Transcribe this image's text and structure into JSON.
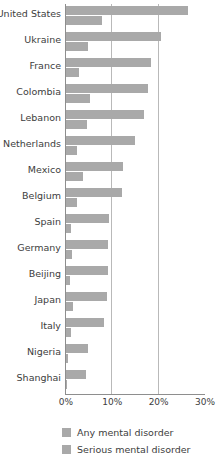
{
  "chart_data": {
    "type": "bar",
    "orientation": "horizontal",
    "title": "",
    "subtitle": "",
    "xlabel": "",
    "ylabel": "",
    "xlim": [
      0,
      30
    ],
    "xtick_labels": [
      "0%",
      "10%",
      "20%",
      "30%"
    ],
    "xtick_values": [
      0,
      10,
      20,
      30
    ],
    "grid": "vertical",
    "legend_position": "bottom",
    "categories": [
      "United States",
      "Ukraine",
      "France",
      "Colombia",
      "Lebanon",
      "Netherlands",
      "Mexico",
      "Belgium",
      "Spain",
      "Germany",
      "Beijing",
      "Japan",
      "Italy",
      "Nigeria",
      "Shanghai"
    ],
    "series": [
      {
        "name": "Any mental disorder",
        "color": "#a9a9a9",
        "values": [
          26.4,
          20.5,
          18.4,
          17.8,
          16.9,
          14.9,
          12.2,
          12.0,
          9.2,
          9.1,
          9.1,
          8.8,
          8.2,
          4.7,
          4.3
        ]
      },
      {
        "name": "Serious mental disorder",
        "color": "#a9a9a9",
        "values": [
          7.7,
          4.8,
          2.7,
          5.2,
          4.6,
          2.3,
          3.7,
          2.4,
          1.0,
          1.2,
          0.9,
          1.5,
          1.0,
          0.4,
          0.3
        ]
      }
    ]
  },
  "legend": {
    "items": [
      {
        "label": "Any mental disorder"
      },
      {
        "label": "Serious mental disorder"
      }
    ]
  }
}
